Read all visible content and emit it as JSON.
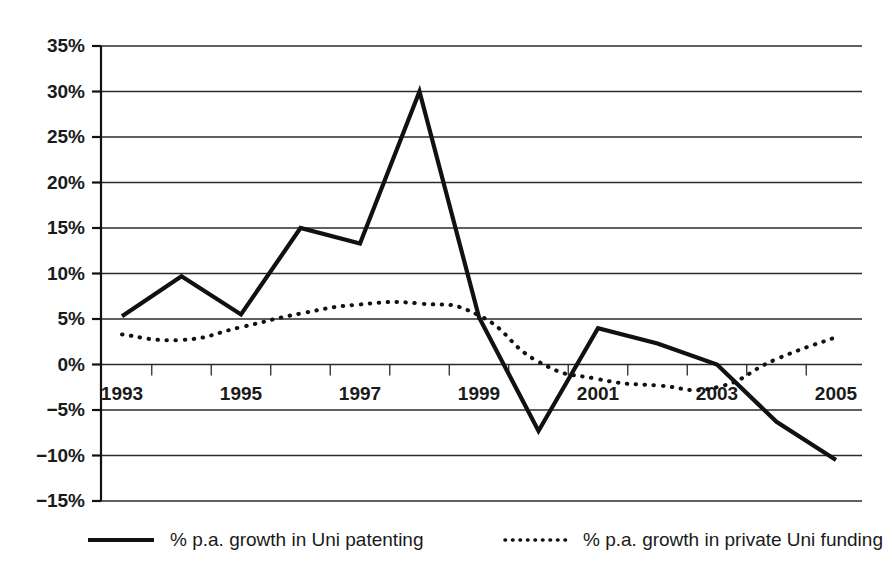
{
  "chart_data": {
    "type": "line",
    "title": "",
    "subtitle": "",
    "xlabel": "",
    "ylabel": "",
    "grid": true,
    "legend_position": "bottom",
    "x": [
      1993,
      1994,
      1995,
      1996,
      1997,
      1998,
      1999,
      2000,
      2001,
      2002,
      2003,
      2004,
      2005
    ],
    "categories": [
      "1993",
      "1994",
      "1995",
      "1996",
      "1997",
      "1998",
      "1999",
      "2000",
      "2001",
      "2002",
      "2003",
      "2004",
      "2005"
    ],
    "xtick_labels": [
      "1993",
      "1995",
      "1997",
      "1999",
      "2001",
      "2003",
      "2005"
    ],
    "xtick_values": [
      1993,
      1995,
      1997,
      1999,
      2001,
      2003,
      2005
    ],
    "xlim": [
      1993,
      2005
    ],
    "ylim": [
      -15,
      35
    ],
    "ytick_labels": [
      "35%",
      "30%",
      "25%",
      "20%",
      "15%",
      "10%",
      "5%",
      "0%",
      "−5%",
      "−10%",
      "−15%"
    ],
    "ytick_values": [
      35,
      30,
      25,
      20,
      15,
      10,
      5,
      0,
      -5,
      -10,
      -15
    ],
    "series": [
      {
        "name": "% p.a. growth in Uni patenting",
        "style": "solid",
        "color": "#111111",
        "values": [
          5.3,
          9.7,
          5.5,
          15.0,
          13.3,
          30.0,
          5.2,
          -7.3,
          4.0,
          2.3,
          0.0,
          -6.3,
          -10.5
        ]
      },
      {
        "name": "% p.a. growth in private Uni funding",
        "style": "dotted",
        "color": "#111111",
        "values": [
          3.3,
          2.7,
          4.1,
          5.6,
          6.6,
          6.7,
          5.4,
          0.3,
          -1.6,
          -2.3,
          -2.5,
          0.6,
          3.0
        ]
      }
    ]
  },
  "legend": {
    "items": [
      {
        "label": "% p.a. growth in Uni patenting",
        "style": "solid"
      },
      {
        "label": "% p.a. growth in private Uni funding",
        "style": "dotted"
      }
    ]
  }
}
